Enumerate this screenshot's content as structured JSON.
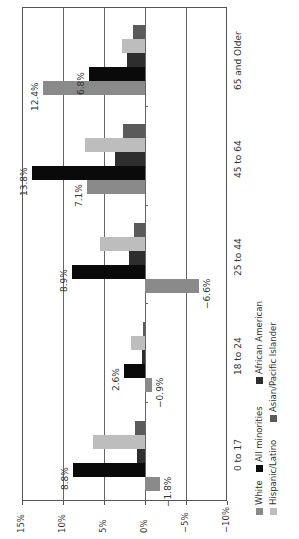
{
  "chart_data": {
    "type": "bar",
    "orientation": "rotated-90-ccw",
    "title": "",
    "xlabel": "",
    "ylabel": "",
    "ylim": [
      -10,
      15
    ],
    "y_ticks": [
      "15%",
      "10%",
      "5%",
      "0%",
      "−5%",
      "−10%"
    ],
    "grid": true,
    "categories": [
      "0 to 17",
      "18 to 24",
      "25 to 44",
      "45 to 64",
      "65 and Older"
    ],
    "series": [
      {
        "name": "White",
        "color": "#8a8a8a",
        "values": [
          -1.8,
          -0.9,
          -6.6,
          7.1,
          12.4
        ]
      },
      {
        "name": "All minorities",
        "color": "#0a0a0a",
        "values": [
          8.8,
          2.6,
          8.9,
          13.8,
          6.8
        ]
      },
      {
        "name": "African American",
        "color": "#2e2e2e",
        "values": [
          1.0,
          0.4,
          2.0,
          3.6,
          2.2
        ]
      },
      {
        "name": "Hispanic/Latino",
        "color": "#bdbdbd",
        "values": [
          6.4,
          1.7,
          5.5,
          7.3,
          2.8
        ]
      },
      {
        "name": "Asian/Pacific Islander",
        "color": "#5a5a5a",
        "values": [
          1.2,
          0.3,
          1.4,
          2.7,
          1.5
        ]
      }
    ],
    "data_labels": [
      {
        "category": "0 to 17",
        "series": "White",
        "text": "−1.8%"
      },
      {
        "category": "0 to 17",
        "series": "All minorities",
        "text": "8.8%"
      },
      {
        "category": "18 to 24",
        "series": "White",
        "text": "−0.9%"
      },
      {
        "category": "18 to 24",
        "series": "All minorities",
        "text": "2.6%"
      },
      {
        "category": "25 to 44",
        "series": "White",
        "text": "−6.6%"
      },
      {
        "category": "25 to 44",
        "series": "All minorities",
        "text": "8.9%"
      },
      {
        "category": "45 to 64",
        "series": "White",
        "text": "7.1%"
      },
      {
        "category": "45 to 64",
        "series": "All minorities",
        "text": "13.8%"
      },
      {
        "category": "65 and Older",
        "series": "White",
        "text": "12.4%"
      },
      {
        "category": "65 and Older",
        "series": "All minorities",
        "text": "6.8%"
      }
    ],
    "legend": {
      "position": "bottom-right (rotated)",
      "columns": [
        [
          "White",
          "All minorities",
          "African American"
        ],
        [
          "Hispanic/Latino",
          "Asian/Pacific Islander"
        ]
      ]
    }
  }
}
